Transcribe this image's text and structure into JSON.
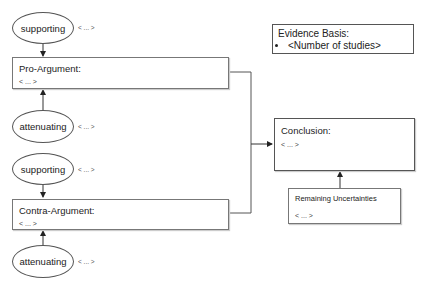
{
  "diagram": {
    "pro": {
      "supporting_label": "supporting",
      "supporting_note": "< ... >",
      "argument_title": "Pro-Argument:",
      "argument_placeholder": "< ... >",
      "attenuating_label": "attenuating",
      "attenuating_note": "< ... >"
    },
    "contra": {
      "supporting_label": "supporting",
      "supporting_note": "< ... >",
      "argument_title": "Contra-Argument:",
      "argument_placeholder": "< ... >",
      "attenuating_label": "attenuating",
      "attenuating_note": "< ... >"
    },
    "evidence": {
      "title": "Evidence Basis:",
      "items": [
        "<Number of studies>"
      ]
    },
    "conclusion": {
      "title": "Conclusion:",
      "placeholder": "< ... >"
    },
    "uncertainties": {
      "title": "Remaining Uncertainties",
      "placeholder": "< ... >"
    },
    "colors": {
      "line": "#333333",
      "border": "#777777",
      "background": "#ffffff"
    }
  }
}
